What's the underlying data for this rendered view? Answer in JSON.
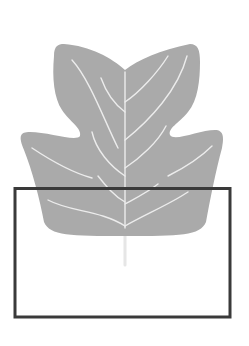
{
  "figure": {
    "colors": {
      "background": "#ffffff",
      "leaf_fill": "#aaaaaa",
      "vein": "#ececec",
      "stem": "#e6e6e6",
      "frame": "#3a3a3a"
    },
    "icons": {
      "leaf": "leaf-icon",
      "frame": "selection-rectangle"
    }
  }
}
